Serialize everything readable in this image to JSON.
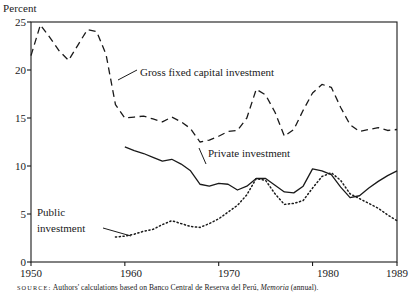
{
  "figure": {
    "y_axis_title": "Percent",
    "source_prefix": "SOURCE:",
    "source_text": "Authors' calculations based on Banco Central de Reserva del Perú,",
    "source_italic": "Memoria",
    "source_suffix": "(annual)."
  },
  "labels": {
    "gross": "Gross fixed capital investment",
    "private": "Private investment",
    "public_line1": "Public",
    "public_line2": "investment"
  },
  "chart_data": {
    "type": "line",
    "title": "",
    "xlabel": "",
    "ylabel": "Percent",
    "xlim": [
      1950,
      1989
    ],
    "ylim": [
      0,
      25
    ],
    "grid": false,
    "legend": "inline-annotations",
    "xticks": [
      1950,
      1960,
      1970,
      1980,
      1989
    ],
    "yticks": [
      0,
      5,
      10,
      15,
      20,
      25
    ],
    "series": [
      {
        "name": "Gross fixed capital investment",
        "style": "dashed",
        "color": "#1a1a1a",
        "x": [
          1950,
          1951,
          1952,
          1953,
          1954,
          1955,
          1956,
          1957,
          1958,
          1959,
          1960,
          1961,
          1962,
          1963,
          1964,
          1965,
          1966,
          1967,
          1968,
          1969,
          1970,
          1971,
          1972,
          1973,
          1974,
          1975,
          1976,
          1977,
          1978,
          1979,
          1980,
          1981,
          1982,
          1983,
          1984,
          1985,
          1986,
          1987,
          1988,
          1989
        ],
        "values": [
          21.5,
          24.7,
          23.4,
          22.0,
          21.0,
          22.6,
          24.2,
          24.0,
          21.6,
          16.4,
          15.0,
          15.1,
          15.2,
          14.9,
          14.6,
          15.1,
          14.6,
          13.9,
          12.5,
          12.7,
          13.1,
          13.6,
          13.7,
          15.0,
          18.0,
          17.4,
          15.6,
          13.1,
          13.8,
          15.8,
          17.6,
          18.5,
          18.2,
          16.1,
          14.3,
          13.6,
          13.8,
          14.0,
          13.7,
          13.8
        ]
      },
      {
        "name": "Private investment",
        "style": "solid",
        "color": "#1a1a1a",
        "x": [
          1960,
          1961,
          1962,
          1963,
          1964,
          1965,
          1966,
          1967,
          1968,
          1969,
          1970,
          1971,
          1972,
          1973,
          1974,
          1975,
          1976,
          1977,
          1978,
          1979,
          1980,
          1981,
          1982,
          1983,
          1984,
          1985,
          1986,
          1987,
          1988,
          1989
        ],
        "values": [
          12.0,
          11.6,
          11.3,
          10.9,
          10.5,
          10.7,
          10.2,
          9.5,
          8.1,
          7.9,
          8.2,
          8.1,
          7.5,
          7.9,
          8.7,
          8.7,
          8.0,
          7.3,
          7.2,
          7.9,
          9.7,
          9.5,
          9.1,
          7.8,
          6.7,
          6.9,
          7.7,
          8.4,
          9.0,
          9.5
        ]
      },
      {
        "name": "Public investment",
        "style": "dotted",
        "color": "#1a1a1a",
        "x": [
          1959,
          1960,
          1961,
          1962,
          1963,
          1964,
          1965,
          1966,
          1967,
          1968,
          1969,
          1970,
          1971,
          1972,
          1973,
          1974,
          1975,
          1976,
          1977,
          1978,
          1979,
          1980,
          1981,
          1982,
          1983,
          1984,
          1985,
          1986,
          1987,
          1988,
          1989
        ],
        "values": [
          2.6,
          2.7,
          2.9,
          3.2,
          3.4,
          3.9,
          4.3,
          4.0,
          3.7,
          3.6,
          4.0,
          4.5,
          5.2,
          5.9,
          7.0,
          8.7,
          8.5,
          7.1,
          6.0,
          6.1,
          6.4,
          7.7,
          8.9,
          9.3,
          8.5,
          7.1,
          6.6,
          6.1,
          5.6,
          4.9,
          4.3
        ]
      }
    ]
  }
}
